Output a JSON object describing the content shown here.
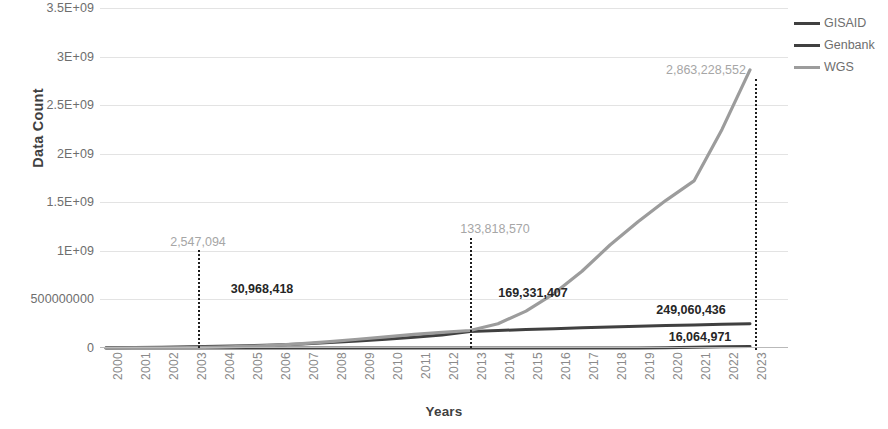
{
  "chart_data": {
    "type": "line",
    "title": "",
    "xlabel": "Years",
    "ylabel": "Data Count",
    "categories": [
      "2000",
      "2001",
      "2002",
      "2003",
      "2004",
      "2005",
      "2006",
      "2007",
      "2008",
      "2009",
      "2010",
      "2011",
      "2012",
      "2013",
      "2014",
      "2015",
      "2016",
      "2017",
      "2018",
      "2019",
      "2020",
      "2021",
      "2022",
      "2023"
    ],
    "ylim": [
      0,
      3500000000
    ],
    "yticks": [
      {
        "label": "3.5E+09",
        "value": 3500000000
      },
      {
        "label": "3E+09",
        "value": 3000000000
      },
      {
        "label": "2.5E+09",
        "value": 2500000000
      },
      {
        "label": "2E+09",
        "value": 2000000000
      },
      {
        "label": "1.5E+09",
        "value": 1500000000
      },
      {
        "label": "1E+09",
        "value": 1000000000
      },
      {
        "label": "500000000",
        "value": 500000000
      },
      {
        "label": "0",
        "value": 0
      }
    ],
    "grid": true,
    "legend_position": "right",
    "series": [
      {
        "name": "GISAID",
        "color": "#404040",
        "values": [
          0,
          0,
          0,
          0,
          0,
          0,
          0,
          0,
          0,
          0,
          0,
          0,
          0,
          0,
          0,
          0,
          0,
          0,
          0,
          0,
          2000000,
          7000000,
          12000000,
          16064971
        ]
      },
      {
        "name": "Genbank",
        "color": "#404040",
        "values": [
          2547094,
          4500000,
          7500000,
          12000000,
          17000000,
          23000000,
          31000000,
          42000000,
          56000000,
          72000000,
          90000000,
          110000000,
          133818570,
          169331407,
          180000000,
          190000000,
          199000000,
          208000000,
          216000000,
          224000000,
          231000000,
          238000000,
          244000000,
          249060436
        ]
      },
      {
        "name": "WGS",
        "color": "#9c9c9c",
        "values": [
          200000,
          600000,
          1500000,
          3500000,
          8000000,
          16000000,
          28000000,
          45000000,
          66000000,
          90000000,
          115000000,
          140000000,
          160000000,
          180000000,
          250000000,
          380000000,
          560000000,
          790000000,
          1060000000,
          1300000000,
          1520000000,
          1720000000,
          2250000000,
          2863228552
        ]
      }
    ],
    "annotations": [
      {
        "label": "2,547,094",
        "year": "2003",
        "style": "light",
        "x_px": 198,
        "y_px": 242
      },
      {
        "label": "30,968,418",
        "year": "2003",
        "style": "dark",
        "x_px": 262,
        "y_px": 289
      },
      {
        "label": "133,818,570",
        "year": "2013",
        "style": "light",
        "x_px": 495,
        "y_px": 229
      },
      {
        "label": "169,331,407",
        "year": "2013",
        "style": "dark",
        "x_px": 533,
        "y_px": 293
      },
      {
        "label": "2,863,228,552",
        "year": "2023",
        "style": "light",
        "x_px": 706,
        "y_px": 70
      },
      {
        "label": "249,060,436",
        "year": "2023",
        "style": "dark",
        "x_px": 691,
        "y_px": 310
      },
      {
        "label": "16,064,971",
        "year": "2023",
        "style": "dark",
        "x_px": 700,
        "y_px": 337
      }
    ],
    "callout_lines": [
      {
        "year": "2003",
        "x_px": 198,
        "top_px": 250,
        "bottom_px": 348
      },
      {
        "year": "2013",
        "x_px": 470,
        "top_px": 238,
        "bottom_px": 348
      },
      {
        "year": "2023",
        "x_px": 755,
        "top_px": 79,
        "bottom_px": 350
      }
    ]
  },
  "legend": {
    "items": [
      {
        "label": "GISAID",
        "color": "#404040"
      },
      {
        "label": "Genbank",
        "color": "#404040"
      },
      {
        "label": "WGS",
        "color": "#9c9c9c"
      }
    ]
  },
  "axis_titles": {
    "y": "Data Count",
    "x": "Years"
  }
}
